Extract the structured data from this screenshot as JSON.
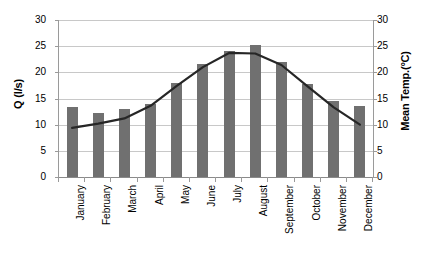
{
  "chart_data": {
    "type": "bar",
    "title": "",
    "subtitle": "",
    "xlabel": "",
    "ylabel": "Q (l/s)",
    "y2label": "Mean Temp.(°C)",
    "categories": [
      "January",
      "February",
      "March",
      "April",
      "May",
      "June",
      "July",
      "August",
      "September",
      "October",
      "November",
      "December"
    ],
    "ylim": [
      0,
      30
    ],
    "y2lim": [
      0,
      30
    ],
    "yticks": [
      "30",
      "25",
      "20",
      "15",
      "10",
      "5",
      "0"
    ],
    "y2ticks": [
      "30",
      "25",
      "20",
      "15",
      "10",
      "5",
      "0"
    ],
    "grid": true,
    "legend": "none",
    "colors": {
      "bar": "#707070",
      "line": "#262626",
      "grid": "#c8c8c8",
      "axis": "#9a9a9a",
      "text": "#000000",
      "background": "#ffffff"
    },
    "series": [
      {
        "name": "Q (l/s)",
        "type": "bar",
        "axis": "left",
        "values": [
          13.3,
          12.3,
          13.0,
          14.0,
          18.0,
          21.6,
          24.0,
          25.3,
          22.0,
          17.8,
          14.5,
          13.5
        ]
      },
      {
        "name": "Mean Temp.(°C)",
        "type": "line",
        "axis": "right",
        "values": [
          9.4,
          10.2,
          11.2,
          13.6,
          17.4,
          21.0,
          23.7,
          23.6,
          21.4,
          17.3,
          13.3,
          10.0
        ]
      }
    ]
  }
}
